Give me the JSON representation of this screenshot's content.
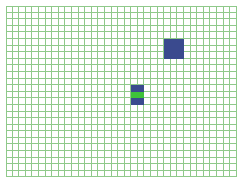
{
  "board": {
    "cols": 35,
    "rows": 26,
    "cell_size": 6.6,
    "grid_color": "#8fc98a",
    "background_color": "#ffffff"
  },
  "pieces": [
    {
      "name": "large-block",
      "color": "#3a4a8e",
      "cells": [
        [
          24,
          5
        ],
        [
          25,
          5
        ],
        [
          26,
          5
        ],
        [
          24,
          6
        ],
        [
          25,
          6
        ],
        [
          26,
          6
        ],
        [
          24,
          7
        ],
        [
          25,
          7
        ],
        [
          26,
          7
        ]
      ]
    },
    {
      "name": "small-piece-top",
      "color": "#3a4a8e",
      "cells": [
        [
          19,
          12
        ],
        [
          20,
          12
        ]
      ]
    },
    {
      "name": "small-piece-middle",
      "color": "#3ec23a",
      "cells": [
        [
          19,
          13
        ],
        [
          20,
          13
        ]
      ]
    },
    {
      "name": "small-piece-bottom",
      "color": "#3a4a8e",
      "cells": [
        [
          19,
          14
        ],
        [
          20,
          14
        ]
      ]
    }
  ]
}
